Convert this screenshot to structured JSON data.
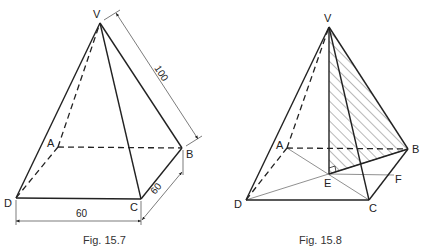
{
  "figures": [
    {
      "caption": "Fig. 15.7",
      "labels": {
        "V": "V",
        "A": "A",
        "B": "B",
        "C": "C",
        "D": "D"
      },
      "dimensions": {
        "slant_edge": "100",
        "base_side_bc": "60",
        "base_side_dc": "60"
      }
    },
    {
      "caption": "Fig. 15.8",
      "labels": {
        "V": "V",
        "A": "A",
        "B": "B",
        "C": "C",
        "D": "D",
        "E": "E",
        "F": "F"
      }
    }
  ]
}
